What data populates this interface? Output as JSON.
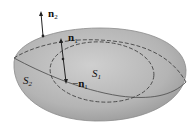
{
  "diagram": {
    "colors": {
      "surface_fill": "#b9b9b9",
      "surface_edge": "#7a7a7a",
      "curve": "#444444",
      "arrow": "#222222",
      "text": "#111111"
    },
    "labels": {
      "n2": {
        "base": "n",
        "sub": "2"
      },
      "n1": {
        "base": "n",
        "sub": "1"
      },
      "neg_n1": {
        "prefix": "−",
        "base": "n",
        "sub": "1"
      },
      "S1": {
        "base": "S",
        "sub": "1"
      },
      "S2": {
        "base": "S",
        "sub": "2"
      }
    }
  }
}
